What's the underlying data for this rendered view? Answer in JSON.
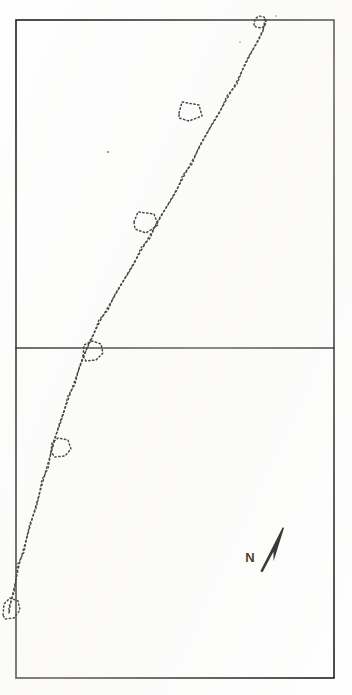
{
  "document": {
    "kind": "hand-drawn-survey-map-sketch",
    "background_color": "#fefefe",
    "ink_color": "#111111",
    "width": 352,
    "height": 695
  },
  "frame": {
    "outer": {
      "x": 16,
      "y": 20,
      "width": 318,
      "height": 658
    },
    "divider_y": 348,
    "panels": [
      {
        "name": "upper-plot",
        "x": 16,
        "y": 20,
        "width": 318,
        "height": 328
      },
      {
        "name": "lower-plot",
        "x": 16,
        "y": 348,
        "width": 318,
        "height": 330
      }
    ]
  },
  "north_arrow": {
    "label": "N",
    "label_x": 250,
    "label_y": 562,
    "tip_x": 284,
    "tip_y": 528,
    "tail_x": 262,
    "tail_y": 572,
    "bearing_deg": 20
  },
  "boundary_trace": {
    "name": "stippled-diagonal-boundary",
    "style": "dotted",
    "enters_at": {
      "x": 266,
      "y": 20
    },
    "exits_at": {
      "x": 9,
      "y": 614
    },
    "points": [
      [
        266,
        20
      ],
      [
        263,
        30
      ],
      [
        257,
        42
      ],
      [
        250,
        55
      ],
      [
        243,
        69
      ],
      [
        236,
        83
      ],
      [
        228,
        97
      ],
      [
        220,
        111
      ],
      [
        212,
        124
      ],
      [
        205,
        137
      ],
      [
        198,
        150
      ],
      [
        191,
        163
      ],
      [
        184,
        176
      ],
      [
        177,
        189
      ],
      [
        170,
        201
      ],
      [
        163,
        213
      ],
      [
        156,
        225
      ],
      [
        149,
        237
      ],
      [
        142,
        249
      ],
      [
        135,
        261
      ],
      [
        128,
        273
      ],
      [
        121,
        285
      ],
      [
        114,
        297
      ],
      [
        107,
        309
      ],
      [
        100,
        321
      ],
      [
        94,
        333
      ],
      [
        88,
        345
      ],
      [
        84,
        356
      ],
      [
        79,
        369
      ],
      [
        74,
        383
      ],
      [
        69,
        397
      ],
      [
        64,
        411
      ],
      [
        59,
        425
      ],
      [
        55,
        439
      ],
      [
        51,
        453
      ],
      [
        47,
        467
      ],
      [
        43,
        481
      ],
      [
        39,
        495
      ],
      [
        35,
        509
      ],
      [
        31,
        523
      ],
      [
        27,
        537
      ],
      [
        23,
        551
      ],
      [
        19,
        565
      ],
      [
        16,
        579
      ],
      [
        13,
        593
      ],
      [
        10,
        606
      ],
      [
        9,
        614
      ]
    ]
  },
  "features": [
    {
      "id": "feature-top-loop",
      "name": "loop-at-top-border",
      "type": "small-closed-loop",
      "center": {
        "x": 262,
        "y": 21
      },
      "points": [
        [
          254,
          25
        ],
        [
          255,
          19
        ],
        [
          259,
          16
        ],
        [
          264,
          17
        ],
        [
          266,
          21
        ],
        [
          265,
          26
        ],
        [
          261,
          28
        ],
        [
          256,
          27
        ]
      ]
    },
    {
      "id": "feature-parcel-1",
      "name": "quadrilateral-parcel-upper",
      "type": "quadrilateral",
      "center": {
        "x": 192,
        "y": 112
      },
      "points": [
        [
          179,
          113
        ],
        [
          182,
          102
        ],
        [
          199,
          105
        ],
        [
          202,
          116
        ],
        [
          189,
          121
        ],
        [
          179,
          118
        ]
      ]
    },
    {
      "id": "feature-parcel-2",
      "name": "quadrilateral-parcel-middle",
      "type": "quadrilateral",
      "center": {
        "x": 146,
        "y": 222
      },
      "points": [
        [
          134,
          222
        ],
        [
          138,
          212
        ],
        [
          154,
          214
        ],
        [
          158,
          225
        ],
        [
          146,
          233
        ],
        [
          135,
          229
        ]
      ]
    },
    {
      "id": "feature-parcel-3",
      "name": "parcel-at-divider",
      "type": "rounded-quadrilateral",
      "center": {
        "x": 92,
        "y": 352
      },
      "points": [
        [
          83,
          356
        ],
        [
          84,
          345
        ],
        [
          92,
          341
        ],
        [
          101,
          344
        ],
        [
          103,
          353
        ],
        [
          96,
          360
        ],
        [
          86,
          361
        ]
      ]
    },
    {
      "id": "feature-parcel-4",
      "name": "rounded-parcel-lower",
      "type": "rounded-shape",
      "center": {
        "x": 60,
        "y": 448
      },
      "points": [
        [
          51,
          452
        ],
        [
          52,
          443
        ],
        [
          58,
          438
        ],
        [
          68,
          440
        ],
        [
          71,
          449
        ],
        [
          65,
          456
        ],
        [
          55,
          457
        ]
      ]
    },
    {
      "id": "feature-bottom-left",
      "name": "parcel-at-bottom-left-border",
      "type": "partial-shape",
      "center": {
        "x": 11,
        "y": 608
      },
      "points": [
        [
          3,
          615
        ],
        [
          4,
          604
        ],
        [
          10,
          598
        ],
        [
          18,
          601
        ],
        [
          20,
          610
        ],
        [
          14,
          618
        ],
        [
          5,
          619
        ]
      ]
    }
  ],
  "specks": [
    {
      "x": 108,
      "y": 152,
      "r": 1.1
    },
    {
      "x": 240,
      "y": 42,
      "r": 0.8
    },
    {
      "x": 276,
      "y": 16,
      "r": 0.8
    }
  ]
}
